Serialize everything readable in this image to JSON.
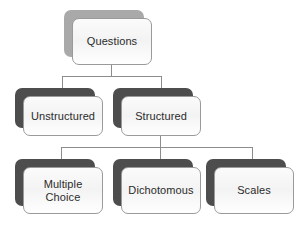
{
  "diagram": {
    "type": "hierarchy-tree",
    "title": "Questions",
    "background_color": "#ffffff",
    "text_color": "#2b2b2b",
    "card_fill_color": "#f7f7f7",
    "card_border_color": "#9a9a9a",
    "connector_color": "#8d8d8d",
    "shadow_color_root": "#a9a9a9",
    "shadow_color_children": "#4d4d4d",
    "nodes": [
      {
        "id": "questions",
        "label": "Questions",
        "level": 1,
        "parent": null,
        "shadow_tone": "light"
      },
      {
        "id": "unstructured",
        "label": "Unstructured",
        "level": 2,
        "parent": "questions",
        "shadow_tone": "dark"
      },
      {
        "id": "structured",
        "label": "Structured",
        "level": 2,
        "parent": "questions",
        "shadow_tone": "dark"
      },
      {
        "id": "multiple-choice",
        "label": "Multiple\nChoice",
        "level": 3,
        "parent": "structured",
        "shadow_tone": "dark"
      },
      {
        "id": "dichotomous",
        "label": "Dichotomous",
        "level": 3,
        "parent": "structured",
        "shadow_tone": "dark"
      },
      {
        "id": "scales",
        "label": "Scales",
        "level": 3,
        "parent": "structured",
        "shadow_tone": "dark"
      }
    ]
  }
}
